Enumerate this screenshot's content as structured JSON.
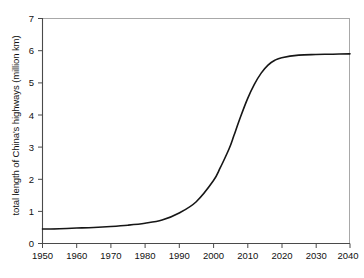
{
  "chart_data": {
    "type": "line",
    "title": "",
    "xlabel": "",
    "ylabel": "total length of China's highways (million km)",
    "xlim": [
      1950,
      2040
    ],
    "ylim": [
      0,
      7
    ],
    "xticks": [
      1950,
      1960,
      1970,
      1980,
      1990,
      2000,
      2010,
      2020,
      2030,
      2040
    ],
    "yticks": [
      0,
      1,
      2,
      3,
      4,
      5,
      6,
      7
    ],
    "grid": false,
    "legend": null,
    "series": [
      {
        "name": "total length of China's highways",
        "x": [
          1950,
          1955,
          1960,
          1965,
          1970,
          1975,
          1980,
          1985,
          1990,
          1995,
          2000,
          2002,
          2004,
          2005,
          2006,
          2008,
          2010,
          2012,
          2014,
          2016,
          2018,
          2020,
          2025,
          2030,
          2035,
          2040
        ],
        "values": [
          0.45,
          0.46,
          0.48,
          0.5,
          0.53,
          0.57,
          0.63,
          0.73,
          0.95,
          1.3,
          1.95,
          2.35,
          2.8,
          3.05,
          3.35,
          3.95,
          4.5,
          4.95,
          5.3,
          5.55,
          5.7,
          5.78,
          5.86,
          5.88,
          5.89,
          5.9
        ]
      }
    ]
  },
  "axes": {
    "y_tick_labels": [
      "0",
      "1",
      "2",
      "3",
      "4",
      "5",
      "6",
      "7"
    ],
    "x_tick_labels": [
      "1950",
      "1960",
      "1970",
      "1980",
      "1990",
      "2000",
      "2010",
      "2020",
      "2030",
      "2040"
    ],
    "y_axis_title": "total length of China's highways (million km)"
  },
  "style": {
    "curve_color": "#161616",
    "axis_color": "#4a4a4a",
    "frame_color": "#a8a8a8",
    "text_color": "#111111",
    "background": "#ffffff"
  }
}
